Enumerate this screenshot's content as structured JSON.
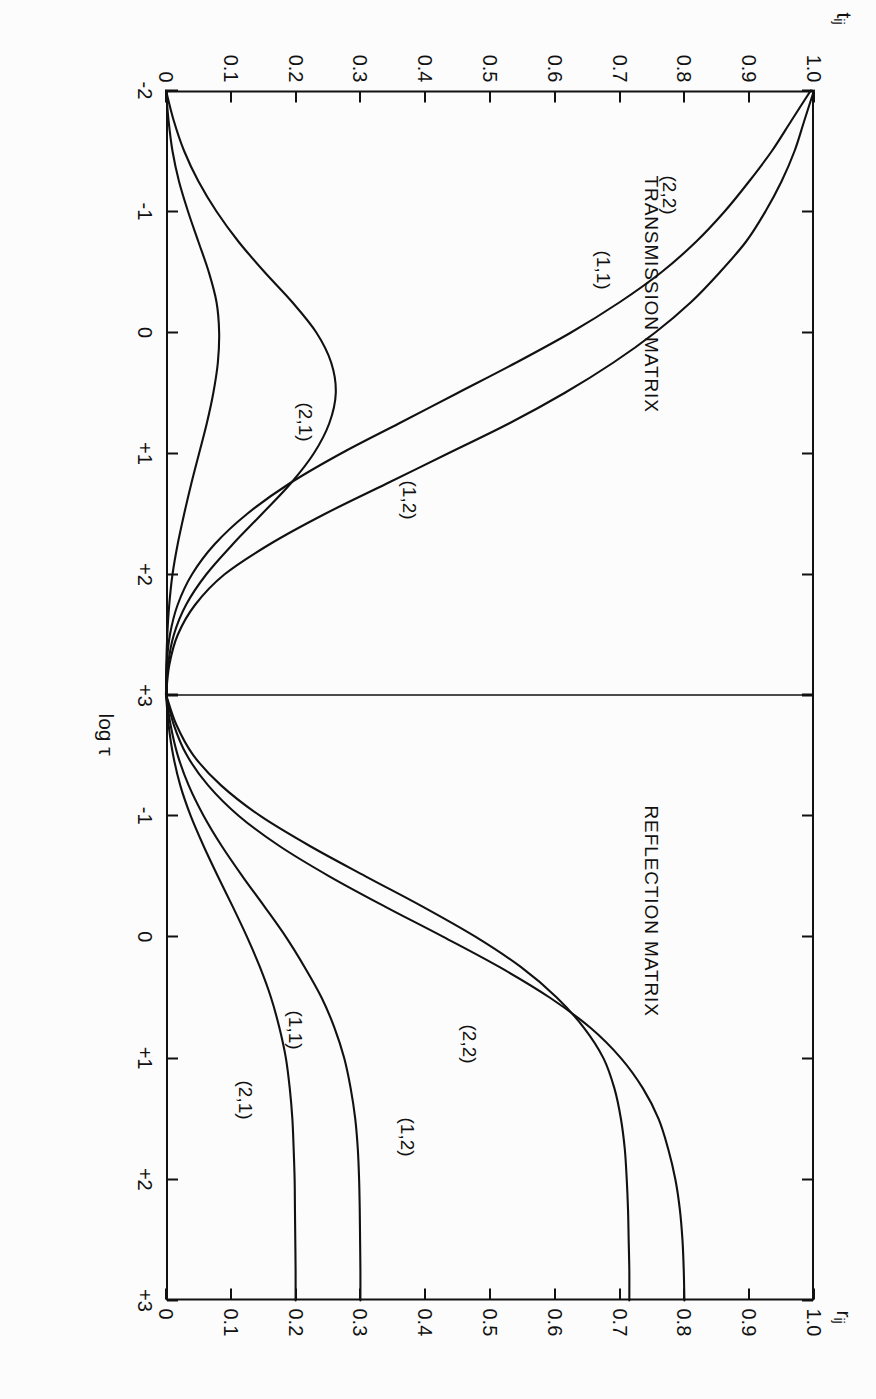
{
  "figure": {
    "orientation": "rotated-90",
    "xaxis_label_prefix": "log ",
    "xaxis_label_symbol": "τ",
    "xaxis_ticks": [
      "-2",
      "-1",
      "0",
      "+1",
      "+2",
      "+3"
    ],
    "xlim": [
      -2,
      3
    ],
    "yticks": [
      "1.0",
      "0.9",
      "0.8",
      "0.7",
      "0.6",
      "0.5",
      "0.4",
      "0.3",
      "0.2",
      "0.1",
      "0"
    ],
    "ylim": [
      0,
      1
    ],
    "ink_color": "#111111",
    "background_color": "#fcfcfc"
  },
  "panels": {
    "transmission": {
      "title": "TRANSMISSION MATRIX",
      "yaxis_symbol": "t",
      "yaxis_subscript": "ij",
      "curve_labels": [
        "(2,2)",
        "(1,1)",
        "(1,2)",
        "(2,1)"
      ]
    },
    "reflection": {
      "title": "REFLECTION MATRIX",
      "yaxis_symbol": "r",
      "yaxis_subscript": "ij",
      "curve_labels": [
        "(2,2)",
        "(1,2)",
        "(1,1)",
        "(2,1)"
      ]
    }
  },
  "chart_data": {
    "type": "line",
    "title": "",
    "xlabel": "log τ",
    "ylabel": "",
    "xlim": [
      -2,
      3
    ],
    "ylim": [
      0,
      1
    ],
    "grid": false,
    "legend": "inline curve labels",
    "panels": [
      {
        "name": "TRANSMISSION MATRIX",
        "ylabel": "t_ij",
        "ylim": [
          0,
          1
        ],
        "yticks": [
          1.0,
          0.9,
          0.8,
          0.7,
          0.6,
          0.5,
          0.4,
          0.3,
          0.2,
          0.1,
          0
        ],
        "x": [
          -2.0,
          -1.75,
          -1.5,
          -1.25,
          -1.0,
          -0.75,
          -0.5,
          -0.25,
          0.0,
          0.25,
          0.5,
          0.75,
          1.0,
          1.25,
          1.5,
          1.75,
          2.0,
          2.25,
          2.5,
          2.75,
          3.0
        ],
        "series": [
          {
            "name": "(2,2)",
            "values": [
              1.0,
              0.985,
              0.97,
              0.95,
              0.925,
              0.895,
              0.855,
              0.81,
              0.755,
              0.69,
              0.615,
              0.53,
              0.435,
              0.34,
              0.245,
              0.16,
              0.09,
              0.045,
              0.018,
              0.005,
              0.0
            ]
          },
          {
            "name": "(1,1)",
            "values": [
              0.995,
              0.965,
              0.935,
              0.9,
              0.862,
              0.818,
              0.765,
              0.7,
              0.625,
              0.54,
              0.45,
              0.36,
              0.27,
              0.19,
              0.125,
              0.075,
              0.04,
              0.018,
              0.006,
              0.001,
              0.0
            ]
          },
          {
            "name": "(1,2)",
            "values": [
              0.0,
              0.012,
              0.028,
              0.05,
              0.078,
              0.112,
              0.152,
              0.195,
              0.232,
              0.255,
              0.262,
              0.252,
              0.228,
              0.192,
              0.148,
              0.103,
              0.062,
              0.031,
              0.012,
              0.003,
              0.0
            ]
          },
          {
            "name": "(2,1)",
            "values": [
              0.0,
              0.004,
              0.01,
              0.02,
              0.034,
              0.05,
              0.066,
              0.078,
              0.082,
              0.08,
              0.073,
              0.063,
              0.051,
              0.039,
              0.028,
              0.018,
              0.01,
              0.005,
              0.002,
              0.0005,
              0.0
            ]
          }
        ]
      },
      {
        "name": "REFLECTION MATRIX",
        "ylabel": "r_ij",
        "ylim": [
          0,
          1
        ],
        "yticks": [
          1.0,
          0.9,
          0.8,
          0.7,
          0.6,
          0.5,
          0.4,
          0.3,
          0.2,
          0.1,
          0
        ],
        "x": [
          -2.0,
          -1.75,
          -1.5,
          -1.25,
          -1.0,
          -0.75,
          -0.5,
          -0.25,
          0.0,
          0.25,
          0.5,
          0.75,
          1.0,
          1.25,
          1.5,
          1.75,
          2.0,
          2.25,
          2.5,
          2.75,
          3.0
        ],
        "series": [
          {
            "name": "(1,2)",
            "values": [
              0.0,
              0.012,
              0.032,
              0.065,
              0.112,
              0.175,
              0.252,
              0.338,
              0.428,
              0.515,
              0.592,
              0.655,
              0.702,
              0.736,
              0.76,
              0.775,
              0.786,
              0.793,
              0.797,
              0.799,
              0.8
            ]
          },
          {
            "name": "(2,2)",
            "values": [
              0.0,
              0.016,
              0.042,
              0.085,
              0.145,
              0.222,
              0.308,
              0.396,
              0.478,
              0.548,
              0.603,
              0.645,
              0.675,
              0.692,
              0.702,
              0.708,
              0.711,
              0.713,
              0.714,
              0.715,
              0.715
            ]
          },
          {
            "name": "(1,1)",
            "values": [
              0.0,
              0.007,
              0.018,
              0.035,
              0.058,
              0.086,
              0.118,
              0.152,
              0.185,
              0.214,
              0.24,
              0.26,
              0.275,
              0.285,
              0.292,
              0.296,
              0.298,
              0.299,
              0.2995,
              0.3,
              0.3
            ]
          },
          {
            "name": "(2,1)",
            "values": [
              0.0,
              0.004,
              0.011,
              0.022,
              0.038,
              0.058,
              0.08,
              0.103,
              0.125,
              0.145,
              0.162,
              0.175,
              0.185,
              0.191,
              0.195,
              0.197,
              0.1985,
              0.199,
              0.1995,
              0.2,
              0.2
            ]
          }
        ]
      }
    ]
  }
}
